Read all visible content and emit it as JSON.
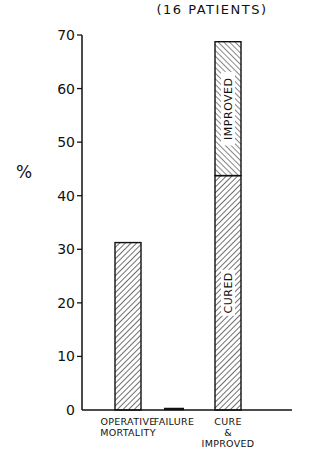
{
  "chart_data": {
    "type": "bar",
    "stacked": true,
    "title": "(16 PATIENTS)",
    "xlabel": "",
    "ylabel": "%",
    "ylim": [
      0,
      70
    ],
    "yticks": [
      0,
      10,
      20,
      30,
      40,
      50,
      60,
      70
    ],
    "ytick_labels": [
      "0",
      "10",
      "20",
      "30",
      "40",
      "50",
      "60",
      "70"
    ],
    "grid": false,
    "categories": [
      {
        "lines": [
          "OPERATIVE",
          "MORTALITY"
        ]
      },
      {
        "lines": [
          "FAILURE"
        ]
      },
      {
        "lines": [
          "CURE",
          "&",
          "IMPROVED"
        ]
      }
    ],
    "series": [
      {
        "name": "base",
        "values": [
          31.25,
          0,
          43.75
        ],
        "segment_labels": [
          "",
          "",
          "CURED"
        ],
        "hatch": "backslash"
      },
      {
        "name": "IMPROVED",
        "values": [
          0,
          0,
          25
        ],
        "segment_labels": [
          "",
          "",
          "IMPROVED"
        ],
        "hatch": "slash"
      }
    ],
    "totals": [
      31.25,
      0,
      68.75
    ]
  }
}
